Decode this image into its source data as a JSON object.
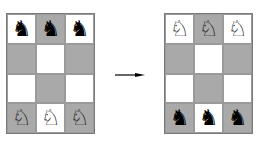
{
  "diagram": {
    "type": "knight-swap-puzzle",
    "board_rows": 4,
    "board_cols": 3,
    "colors": {
      "light_square": "#ffffff",
      "dark_square": "#a9a9a9",
      "border": "#7a7a7a"
    },
    "start": {
      "label": "initial position",
      "squares": [
        [
          {
            "shade": "light",
            "piece": "♞"
          },
          {
            "shade": "dark",
            "piece": "♞"
          },
          {
            "shade": "light",
            "piece": "♞"
          }
        ],
        [
          {
            "shade": "dark",
            "piece": ""
          },
          {
            "shade": "light",
            "piece": ""
          },
          {
            "shade": "dark",
            "piece": ""
          }
        ],
        [
          {
            "shade": "light",
            "piece": ""
          },
          {
            "shade": "dark",
            "piece": ""
          },
          {
            "shade": "light",
            "piece": ""
          }
        ],
        [
          {
            "shade": "dark",
            "piece": "♘"
          },
          {
            "shade": "light",
            "piece": "♘"
          },
          {
            "shade": "dark",
            "piece": "♘"
          }
        ]
      ]
    },
    "arrow": {
      "direction": "right",
      "icon": "arrow-right-icon"
    },
    "goal": {
      "label": "target position",
      "squares": [
        [
          {
            "shade": "light",
            "piece": "♘"
          },
          {
            "shade": "dark",
            "piece": "♘"
          },
          {
            "shade": "light",
            "piece": "♘"
          }
        ],
        [
          {
            "shade": "dark",
            "piece": ""
          },
          {
            "shade": "light",
            "piece": ""
          },
          {
            "shade": "dark",
            "piece": ""
          }
        ],
        [
          {
            "shade": "light",
            "piece": ""
          },
          {
            "shade": "dark",
            "piece": ""
          },
          {
            "shade": "light",
            "piece": ""
          }
        ],
        [
          {
            "shade": "dark",
            "piece": "♞"
          },
          {
            "shade": "light",
            "piece": "♞"
          },
          {
            "shade": "dark",
            "piece": "♞"
          }
        ]
      ]
    }
  }
}
